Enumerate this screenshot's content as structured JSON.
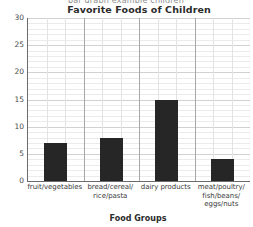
{
  "header": {
    "cutoff_text": "bar graph example children"
  },
  "chart_data": {
    "type": "bar",
    "title": "Favorite Foods of Children",
    "xlabel": "Food Groups",
    "ylabel": "Number of Children",
    "categories": [
      "fruit/vegetables",
      "bread/cereal/\nrice/pasta",
      "dairy products",
      "meat/poultry/\nfish/beans/\neggs/nuts"
    ],
    "values": [
      7,
      8,
      15,
      4
    ],
    "ylim": [
      0,
      30
    ],
    "ytick_labels": [
      "0",
      "5",
      "10",
      "15",
      "20",
      "25",
      "30"
    ],
    "ytick_values": [
      0,
      5,
      10,
      15,
      20,
      25,
      30
    ],
    "y_major_step": 5,
    "y_minor_step": 1,
    "grid": true,
    "legend": false,
    "bar_color": "#262626",
    "grid_color_minor": "#eceaea",
    "grid_color_major": "#d2d0d0",
    "axis_color": "#6b6b6b"
  }
}
